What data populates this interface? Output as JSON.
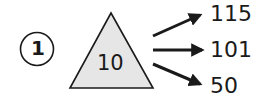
{
  "problem": {
    "number": "1",
    "center_value": "10",
    "outputs": [
      "115",
      "101",
      "50"
    ],
    "colors": {
      "triangle_fill": "#e6e6e6",
      "stroke": "#1a1a1a"
    }
  }
}
